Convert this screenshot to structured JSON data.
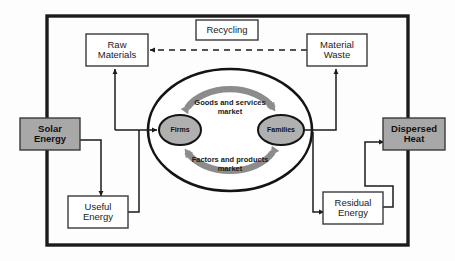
{
  "diagram": {
    "frame": {
      "label": "environment-system-boundary"
    },
    "colors": {
      "gray_box_fill": "#a8a8a8",
      "node_fill": "#b0b0b0",
      "arrow_gray": "#8c8c8c",
      "stroke_dark": "#1b1b1b",
      "box_stroke": "#3a3a3a",
      "background": "#fdfdfd"
    },
    "boxes": [
      {
        "id": "recycling",
        "label": "Recycling",
        "style": "white"
      },
      {
        "id": "raw_materials",
        "label": "Raw\nMaterials",
        "line1": "Raw",
        "line2": "Materials",
        "style": "white"
      },
      {
        "id": "material_waste",
        "label": "Material\nWaste",
        "line1": "Material",
        "line2": "Waste",
        "style": "white"
      },
      {
        "id": "solar_energy",
        "label": "Solar\nEnergy",
        "line1": "Solar",
        "line2": "Energy",
        "style": "gray"
      },
      {
        "id": "dispersed_heat",
        "label": "Dispersed\nHeat",
        "line1": "Dispersed",
        "line2": "Heat",
        "style": "gray"
      },
      {
        "id": "useful_energy",
        "label": "Useful\nEnergy",
        "line1": "Useful",
        "line2": "Energy",
        "style": "white"
      },
      {
        "id": "residual_energy",
        "label": "Residual\nEnergy",
        "line1": "Residual",
        "line2": "Energy",
        "style": "white"
      }
    ],
    "nodes": [
      {
        "id": "firms",
        "label": "Firms"
      },
      {
        "id": "families",
        "label": "Families"
      }
    ],
    "market_flows": [
      {
        "id": "goods_services",
        "line1": "Goods and services",
        "line2": "market",
        "direction": "families-to-firms"
      },
      {
        "id": "factors_products",
        "line1": "Factors and products",
        "line2": "market",
        "direction": "firms-to-families"
      }
    ],
    "connectors": [
      {
        "id": "recycling-flow",
        "from": "material_waste",
        "to": "raw_materials",
        "style": "dashed",
        "arrow": "left"
      },
      {
        "id": "raw-materials-to-firms",
        "from": "firms",
        "to": "raw_materials",
        "style": "solid",
        "arrow": "up"
      },
      {
        "id": "solar-to-useful",
        "from": "solar_energy",
        "to": "useful_energy",
        "style": "solid",
        "arrow": "down"
      },
      {
        "id": "useful-to-firms",
        "from": "useful_energy",
        "to": "firms",
        "style": "solid",
        "arrow": "right"
      },
      {
        "id": "families-to-material-waste",
        "from": "families",
        "to": "material_waste",
        "style": "solid",
        "arrow": "up"
      },
      {
        "id": "families-to-residual",
        "from": "families",
        "to": "residual_energy",
        "style": "solid",
        "arrow": "down"
      },
      {
        "id": "residual-to-dispersed",
        "from": "residual_energy",
        "to": "dispersed_heat",
        "style": "solid",
        "arrow": "right"
      }
    ]
  }
}
